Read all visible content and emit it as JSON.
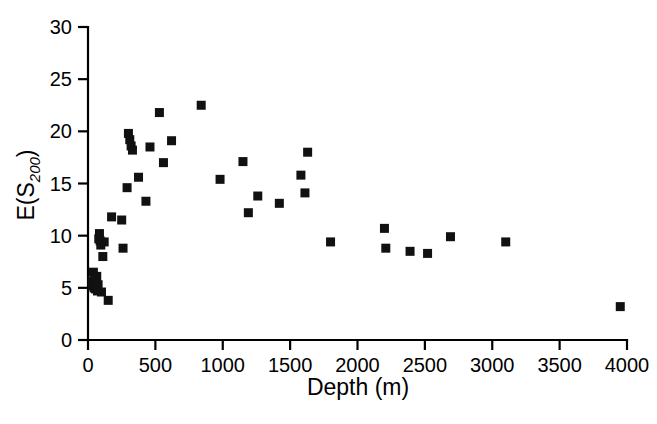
{
  "chart_data": {
    "type": "scatter",
    "title": "",
    "subtitle": "",
    "xlabel": "Depth (m)",
    "ylabel": "E(S200)",
    "ylabel_base": "E(S",
    "ylabel_sub": "200",
    "ylabel_close": ")",
    "xlim": [
      0,
      4000
    ],
    "ylim": [
      0,
      30
    ],
    "xticks": [
      0,
      500,
      1000,
      1500,
      2000,
      2500,
      3000,
      3500,
      4000
    ],
    "xticklabels": [
      "0",
      "500",
      "1000",
      "1500",
      "2000",
      "2500",
      "3000",
      "3500",
      "4000"
    ],
    "yticks": [
      0,
      5,
      10,
      15,
      20,
      25,
      30
    ],
    "yticklabels": [
      "0",
      "5",
      "10",
      "15",
      "20",
      "25",
      "30"
    ],
    "grid": false,
    "legend": null,
    "marker": "square",
    "marker_color": "#111111",
    "series": [
      {
        "name": "E(S200) vs Depth",
        "points": [
          [
            30,
            5.6
          ],
          [
            35,
            5.2
          ],
          [
            40,
            6.5
          ],
          [
            45,
            5.0
          ],
          [
            50,
            5.8
          ],
          [
            55,
            4.9
          ],
          [
            60,
            5.4
          ],
          [
            65,
            6.1
          ],
          [
            70,
            4.7
          ],
          [
            75,
            5.3
          ],
          [
            80,
            9.7
          ],
          [
            85,
            10.2
          ],
          [
            90,
            9.5
          ],
          [
            95,
            9.1
          ],
          [
            100,
            4.6
          ],
          [
            110,
            8.0
          ],
          [
            120,
            9.4
          ],
          [
            150,
            3.8
          ],
          [
            175,
            11.8
          ],
          [
            250,
            11.5
          ],
          [
            260,
            8.8
          ],
          [
            290,
            14.6
          ],
          [
            300,
            19.8
          ],
          [
            310,
            19.2
          ],
          [
            320,
            18.6
          ],
          [
            330,
            18.2
          ],
          [
            375,
            15.6
          ],
          [
            430,
            13.3
          ],
          [
            460,
            18.5
          ],
          [
            530,
            21.8
          ],
          [
            560,
            17.0
          ],
          [
            620,
            19.1
          ],
          [
            840,
            22.5
          ],
          [
            980,
            15.4
          ],
          [
            1150,
            17.1
          ],
          [
            1190,
            12.2
          ],
          [
            1260,
            13.8
          ],
          [
            1420,
            13.1
          ],
          [
            1580,
            15.8
          ],
          [
            1610,
            14.1
          ],
          [
            1630,
            18.0
          ],
          [
            1800,
            9.4
          ],
          [
            2200,
            10.7
          ],
          [
            2210,
            8.8
          ],
          [
            2390,
            8.5
          ],
          [
            2520,
            8.3
          ],
          [
            2690,
            9.9
          ],
          [
            3100,
            9.4
          ],
          [
            3950,
            3.2
          ]
        ]
      }
    ]
  },
  "axes": {
    "plot_left_px": 88,
    "plot_right_px": 627,
    "plot_top_px": 27,
    "plot_bottom_px": 340
  }
}
